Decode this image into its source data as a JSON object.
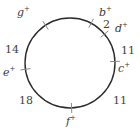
{
  "figure": {
    "type": "cycle-graph-diagram",
    "circle": {
      "cx": 70,
      "cy": 63,
      "r": 45,
      "stroke_color": "#2b2b2b",
      "stroke_width": 1.4,
      "fill": "none"
    },
    "tick_color": "#8a8a8a",
    "nodes": [
      {
        "id": "b",
        "letter": "b",
        "sign": "+",
        "angle_deg": 62,
        "label_x": 99,
        "label_y": 7,
        "tick": true
      },
      {
        "id": "d",
        "letter": "d",
        "sign": "+",
        "angle_deg": 40,
        "label_x": 115,
        "label_y": 23,
        "tick": true
      },
      {
        "id": "c",
        "letter": "c",
        "sign": "+",
        "angle_deg": 2,
        "label_x": 118,
        "label_y": 63,
        "tick": true
      },
      {
        "id": "f",
        "letter": "f",
        "sign": "+",
        "angle_deg": -88,
        "label_x": 66,
        "label_y": 116,
        "tick": true
      },
      {
        "id": "e",
        "letter": "e",
        "sign": "+",
        "angle_deg": 188,
        "label_x": 3,
        "label_y": 67,
        "tick": true
      },
      {
        "id": "g",
        "letter": "g",
        "sign": "+",
        "angle_deg": 123,
        "label_x": 17,
        "label_y": 7,
        "tick": true
      }
    ],
    "weights": [
      {
        "id": "w-b-d",
        "value": "2",
        "between": [
          "b",
          "d"
        ],
        "x": 103,
        "y": 19
      },
      {
        "id": "w-d-c",
        "value": "11",
        "between": [
          "d",
          "c"
        ],
        "x": 121,
        "y": 45
      },
      {
        "id": "w-c-f",
        "value": "11",
        "between": [
          "c",
          "f"
        ],
        "x": 113,
        "y": 95
      },
      {
        "id": "w-f-e",
        "value": "18",
        "between": [
          "f",
          "e"
        ],
        "x": 19,
        "y": 95
      },
      {
        "id": "w-e-g",
        "value": "14",
        "between": [
          "e",
          "g"
        ],
        "x": 5,
        "y": 44
      }
    ]
  }
}
